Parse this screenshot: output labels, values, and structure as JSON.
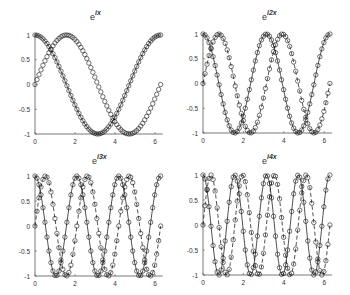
{
  "figure": {
    "layout": "2x2",
    "background": "#ffffff",
    "line_color": "#000000",
    "axis_color": "#555555"
  },
  "chart_data": [
    {
      "type": "line",
      "title": "e^{ix}",
      "title_base": "e",
      "title_sup": "ix",
      "xlabel": "",
      "ylabel": "",
      "xlim": [
        0,
        6.2832
      ],
      "ylim": [
        -1,
        1
      ],
      "xticks": [
        0,
        2,
        4,
        6
      ],
      "yticks": [
        -1,
        -0.5,
        0,
        0.5,
        1
      ],
      "ytick_labels": [
        "-1",
        "-0.5",
        "0",
        "0.5",
        "1"
      ],
      "grid": false,
      "frequency": 1,
      "samples": 64,
      "series": [
        {
          "name": "cos(x)",
          "function": "cos",
          "line": "solid",
          "marker": "circle"
        },
        {
          "name": "sin(x)",
          "function": "sin",
          "line": "none",
          "marker": "circle"
        }
      ]
    },
    {
      "type": "line",
      "title": "e^{i2x}",
      "title_base": "e",
      "title_sup": "i2x",
      "xlabel": "",
      "ylabel": "",
      "xlim": [
        0,
        6.2832
      ],
      "ylim": [
        -1,
        1
      ],
      "xticks": [
        0,
        2,
        4,
        6
      ],
      "yticks": [
        -1,
        -0.5,
        0,
        0.5,
        1
      ],
      "ytick_labels": [
        "-1",
        "-0.5",
        "0",
        "0.5",
        "1"
      ],
      "grid": false,
      "frequency": 2,
      "samples": 64,
      "series": [
        {
          "name": "cos(2x)",
          "function": "cos",
          "line": "solid",
          "marker": "circle"
        },
        {
          "name": "sin(2x)",
          "function": "sin",
          "line": "dashed",
          "marker": "circle"
        }
      ]
    },
    {
      "type": "line",
      "title": "e^{i3x}",
      "title_base": "e",
      "title_sup": "i3x",
      "xlabel": "",
      "ylabel": "",
      "xlim": [
        0,
        6.2832
      ],
      "ylim": [
        -1,
        1
      ],
      "xticks": [
        0,
        2,
        4,
        6
      ],
      "yticks": [
        -1,
        -0.5,
        0,
        0.5,
        1
      ],
      "ytick_labels": [
        "-1",
        "-0.5",
        "0",
        "0.5",
        "1"
      ],
      "grid": false,
      "frequency": 3,
      "samples": 64,
      "series": [
        {
          "name": "cos(3x)",
          "function": "cos",
          "line": "solid",
          "marker": "circle"
        },
        {
          "name": "sin(3x)",
          "function": "sin",
          "line": "dashed",
          "marker": "circle"
        }
      ]
    },
    {
      "type": "line",
      "title": "e^{i4x}",
      "title_base": "e",
      "title_sup": "i4x",
      "xlabel": "",
      "ylabel": "",
      "xlim": [
        0,
        6.2832
      ],
      "ylim": [
        -1,
        1
      ],
      "xticks": [
        0,
        2,
        4,
        6
      ],
      "yticks": [
        -1,
        -0.5,
        0,
        0.5,
        1
      ],
      "ytick_labels": [
        "-1",
        "-0.5",
        "0",
        "0.5",
        "1"
      ],
      "grid": false,
      "frequency": 4,
      "samples": 64,
      "series": [
        {
          "name": "cos(4x)",
          "function": "cos",
          "line": "solid",
          "marker": "circle"
        },
        {
          "name": "sin(4x)",
          "function": "sin",
          "line": "dashed",
          "marker": "circle"
        }
      ]
    }
  ],
  "panels": [
    {
      "x0": 35,
      "y_top": 35,
      "y_bot": 134,
      "px_per_unit": 20.0,
      "title_x": 90,
      "title_y": 20
    },
    {
      "x0": 203,
      "y_top": 34,
      "y_bot": 133,
      "px_per_unit": 20.2,
      "title_x": 262,
      "title_y": 20
    },
    {
      "x0": 35,
      "y_top": 176,
      "y_bot": 276,
      "px_per_unit": 20.0,
      "title_x": 92,
      "title_y": 164
    },
    {
      "x0": 203,
      "y_top": 175,
      "y_bot": 275,
      "px_per_unit": 20.2,
      "title_x": 262,
      "title_y": 164
    }
  ]
}
